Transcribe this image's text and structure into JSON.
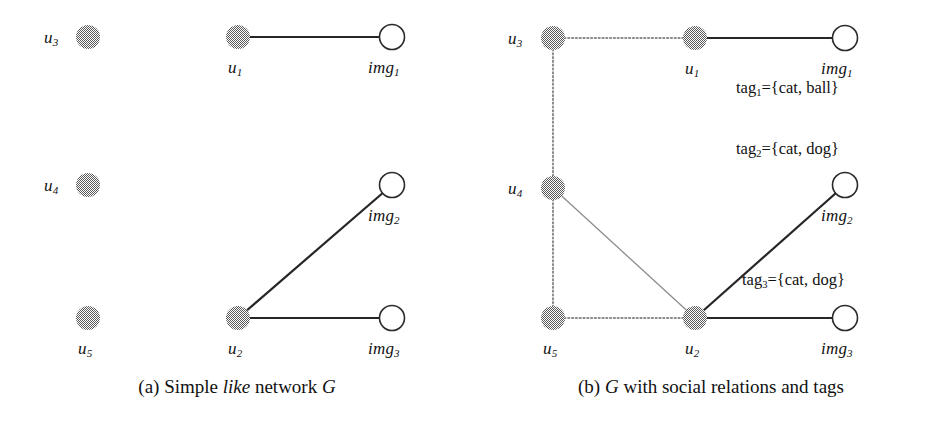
{
  "figure": {
    "panels": [
      {
        "id": "a",
        "caption_prefix": "(a) Simple ",
        "caption_italic_1": "like",
        "caption_mid": " network ",
        "caption_italic_2": "G",
        "caption_full": "(a) Simple like network G",
        "nodes": [
          {
            "id": "u3",
            "label": "u",
            "sub": "3",
            "type": "user",
            "x": 88,
            "y": 37,
            "label_x": 44,
            "label_y": 28,
            "label_pos": "left"
          },
          {
            "id": "u1",
            "label": "u",
            "sub": "1",
            "type": "user",
            "x": 238,
            "y": 37,
            "label_x": 228,
            "label_y": 58,
            "label_pos": "below"
          },
          {
            "id": "img1",
            "label": "img",
            "sub": "1",
            "type": "image",
            "x": 392,
            "y": 37,
            "label_x": 368,
            "label_y": 58,
            "label_pos": "below"
          },
          {
            "id": "u4",
            "label": "u",
            "sub": "4",
            "type": "user",
            "x": 88,
            "y": 185,
            "label_x": 44,
            "label_y": 176,
            "label_pos": "left"
          },
          {
            "id": "img2",
            "label": "img",
            "sub": "2",
            "type": "image",
            "x": 392,
            "y": 185,
            "label_x": 368,
            "label_y": 206,
            "label_pos": "below"
          },
          {
            "id": "u5",
            "label": "u",
            "sub": "5",
            "type": "user",
            "x": 88,
            "y": 318,
            "label_x": 78,
            "label_y": 339,
            "label_pos": "below"
          },
          {
            "id": "u2",
            "label": "u",
            "sub": "2",
            "type": "user",
            "x": 238,
            "y": 318,
            "label_x": 228,
            "label_y": 339,
            "label_pos": "below"
          },
          {
            "id": "img3",
            "label": "img",
            "sub": "3",
            "type": "image",
            "x": 392,
            "y": 318,
            "label_x": 368,
            "label_y": 339,
            "label_pos": "below"
          }
        ],
        "edges": [
          {
            "from": "u1",
            "to": "img1",
            "kind": "like"
          },
          {
            "from": "u2",
            "to": "img2",
            "kind": "like"
          },
          {
            "from": "u2",
            "to": "img3",
            "kind": "like"
          }
        ],
        "tags": []
      },
      {
        "id": "b",
        "caption_prefix": "(b) ",
        "caption_italic_1": "G",
        "caption_mid": " with social relations and tags",
        "caption_italic_2": "",
        "caption_full": "(b) G with social relations and tags",
        "nodes": [
          {
            "id": "u3",
            "label": "u",
            "sub": "3",
            "type": "user",
            "x": 79,
            "y": 38,
            "label_x": 34,
            "label_y": 29,
            "label_pos": "left"
          },
          {
            "id": "u1",
            "label": "u",
            "sub": "1",
            "type": "user",
            "x": 221,
            "y": 38,
            "label_x": 211,
            "label_y": 59,
            "label_pos": "below"
          },
          {
            "id": "img1",
            "label": "img",
            "sub": "1",
            "type": "image",
            "x": 371,
            "y": 38,
            "label_x": 347,
            "label_y": 59,
            "label_pos": "below"
          },
          {
            "id": "u4",
            "label": "u",
            "sub": "4",
            "type": "user",
            "x": 79,
            "y": 188,
            "label_x": 34,
            "label_y": 179,
            "label_pos": "left"
          },
          {
            "id": "img2",
            "label": "img",
            "sub": "2",
            "type": "image",
            "x": 371,
            "y": 185,
            "label_x": 347,
            "label_y": 206,
            "label_pos": "below"
          },
          {
            "id": "u5",
            "label": "u",
            "sub": "5",
            "type": "user",
            "x": 79,
            "y": 318,
            "label_x": 69,
            "label_y": 339,
            "label_pos": "below"
          },
          {
            "id": "u2",
            "label": "u",
            "sub": "2",
            "type": "user",
            "x": 221,
            "y": 318,
            "label_x": 211,
            "label_y": 339,
            "label_pos": "below"
          },
          {
            "id": "img3",
            "label": "img",
            "sub": "3",
            "type": "image",
            "x": 371,
            "y": 318,
            "label_x": 347,
            "label_y": 339,
            "label_pos": "below"
          }
        ],
        "edges": [
          {
            "from": "u1",
            "to": "img1",
            "kind": "like"
          },
          {
            "from": "u2",
            "to": "img2",
            "kind": "like"
          },
          {
            "from": "u2",
            "to": "img3",
            "kind": "like"
          },
          {
            "from": "u3",
            "to": "u1",
            "kind": "social"
          },
          {
            "from": "u3",
            "to": "u4",
            "kind": "social"
          },
          {
            "from": "u4",
            "to": "u5",
            "kind": "social"
          },
          {
            "from": "u5",
            "to": "u2",
            "kind": "social"
          },
          {
            "from": "u4",
            "to": "u2",
            "kind": "social-thin"
          }
        ],
        "tags": [
          {
            "id": "tag1",
            "name": "tag",
            "sub": "1",
            "text": "={cat, ball}",
            "full": "tag1={cat, ball}",
            "x": 262,
            "y": 78
          },
          {
            "id": "tag2",
            "name": "tag",
            "sub": "2",
            "text": "={cat, dog}",
            "full": "tag2={cat, dog}",
            "x": 262,
            "y": 139
          },
          {
            "id": "tag3",
            "name": "tag",
            "sub": "3",
            "text": "={cat, dog}",
            "full": "tag3={cat, dog}",
            "x": 268,
            "y": 270
          }
        ]
      }
    ],
    "style": {
      "user_node_fill": "#9a9a9a",
      "user_node_radius": 12,
      "image_node_stroke": "#2b2b2b",
      "image_node_fill": "#ffffff",
      "image_node_radius": 12.5,
      "like_edge_color": "#262626",
      "social_edge_color": "#8c8c8c",
      "background": "#ffffff"
    },
    "caption_y": 376
  }
}
